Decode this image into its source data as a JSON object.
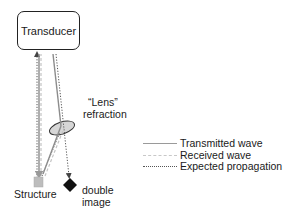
{
  "diagram": {
    "transducer_label": "Transducer",
    "lens_label_line1": "“Lens”",
    "lens_label_line2": "refraction",
    "structure_label": "Structure",
    "double_image_line1": "double",
    "double_image_line2": "image"
  },
  "legend": {
    "items": [
      {
        "label": "Transmitted wave",
        "style": "solid",
        "color": "#9a9a9a"
      },
      {
        "label": "Received wave",
        "style": "dashed",
        "color": "#c8c8c8"
      },
      {
        "label": "Expected propagation",
        "style": "dotted",
        "color": "#555555"
      }
    ]
  },
  "colors": {
    "transmitted": "#8c8c8c",
    "received": "#c4c4c4",
    "expected": "#555555",
    "structure": "#bdbdbd",
    "double_image": "#111111",
    "lens_fill": "#d0d0d0"
  }
}
